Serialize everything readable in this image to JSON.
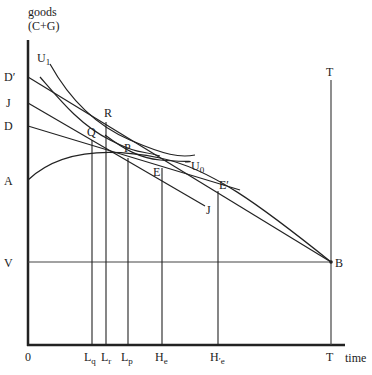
{
  "diagram": {
    "y_axis_label_line1": "goods",
    "y_axis_label_line2": "(C+G)",
    "x_axis_label": "time",
    "origin_label": "0",
    "y_labels": {
      "D_prime": "D′",
      "J": "J",
      "D": "D",
      "A": "A",
      "V": "V"
    },
    "point_labels": {
      "U1": "U",
      "U1_sub": "1",
      "U0": "U",
      "U0_sub": "0",
      "R": "R",
      "Q": "Q",
      "P": "P",
      "E": "E",
      "E_prime": "E′",
      "J_end": "J",
      "B": "B",
      "T_top": "T"
    },
    "x_labels": {
      "Lq": "L",
      "Lq_sub": "q",
      "Lr": "L",
      "Lr_sub": "r",
      "Lp": "L",
      "Lp_sub": "p",
      "He": "H",
      "He_sub": "e",
      "He_prime": "H",
      "He_prime_sub": "′e",
      "T": "T"
    },
    "line_color": "#222222"
  }
}
